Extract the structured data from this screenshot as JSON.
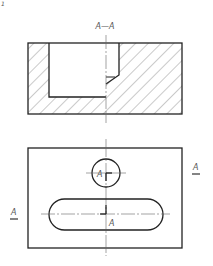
{
  "figure": {
    "corner_mark": "1",
    "section_view": {
      "title": "A—A",
      "hatch_pattern": "diagonal-45"
    },
    "top_view": {
      "circle_label": "A",
      "slot_label": "A",
      "left_marker": "A",
      "right_marker": "A"
    }
  },
  "colors": {
    "line": "#222222",
    "thin_line": "#666666",
    "text": "#555555",
    "background": "#ffffff"
  }
}
